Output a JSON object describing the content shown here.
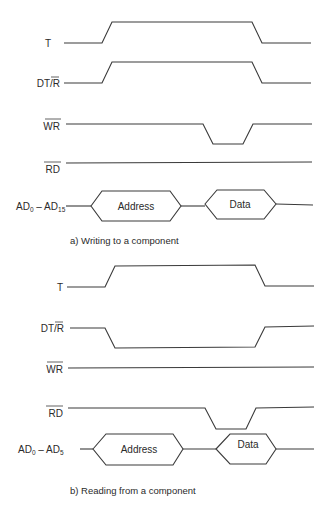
{
  "diagram": {
    "type": "timing-diagram",
    "stroke_color": "#3a3a3a",
    "background": "#ffffff",
    "panel_a": {
      "caption": "a) Writing to a component",
      "signals": {
        "t": {
          "label": "T"
        },
        "dtr": {
          "label_main": "DT/",
          "label_bar": "R"
        },
        "wr": {
          "label_bar": "WR"
        },
        "rd": {
          "label_bar": "RD"
        },
        "bus": {
          "label_ad": "AD",
          "sub_start": "0",
          "dash": " – ",
          "label_ad2": "AD",
          "sub_end": "15"
        }
      },
      "bus_fields": {
        "address": "Address",
        "data": "Data"
      }
    },
    "panel_b": {
      "caption": "b) Reading from a component",
      "signals": {
        "t": {
          "label": "T"
        },
        "dtr": {
          "label_main": "DT/",
          "label_bar": "R"
        },
        "wr": {
          "label_bar": "WR"
        },
        "rd": {
          "label_bar": "RD"
        },
        "bus": {
          "label_ad": "AD",
          "sub_start": "0",
          "dash": " – ",
          "label_ad2": "AD",
          "sub_end": "5"
        }
      },
      "bus_fields": {
        "address": "Address",
        "data": "Data"
      }
    }
  }
}
